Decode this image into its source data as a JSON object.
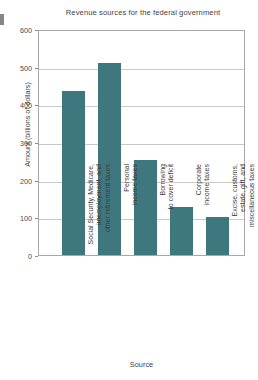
{
  "chart_data": {
    "type": "bar",
    "title": "Revenue sources for the federal government",
    "xlabel": "Source",
    "ylabel": "Amount (billions of dollars)",
    "ylim": [
      0,
      600
    ],
    "ytick_labels": [
      "600",
      "500",
      "400",
      "300",
      "200",
      "100",
      "0"
    ],
    "yticks": [
      600,
      500,
      400,
      300,
      200,
      100,
      0
    ],
    "grid": true,
    "legend": "none",
    "bar_color": "#3f777f",
    "categories": [
      "Social Security, Medicare,\nunemployment, and\nother retirement taxes",
      "Personal\nincome taxes",
      "Borrowing\nto cover deficit",
      "Corporate\nincome taxes",
      "Excise, customs,\nestate, gift, and\nmiscellaneous taxes"
    ],
    "values": [
      436,
      510,
      252,
      127,
      102
    ]
  }
}
